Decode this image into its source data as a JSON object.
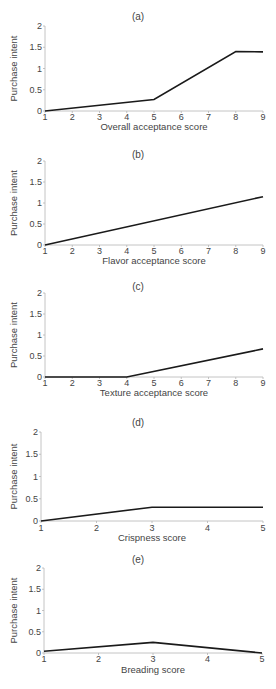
{
  "chart_data": [
    {
      "type": "line",
      "panel": "(a)",
      "title": "(a)",
      "xlabel": "Overall acceptance score",
      "ylabel": "Purchase intent",
      "x": [
        1,
        5,
        8,
        9
      ],
      "series": [
        {
          "name": "Purchase intent",
          "values": [
            0,
            0.27,
            1.4,
            1.39
          ]
        }
      ],
      "xticks": [
        1,
        2,
        3,
        4,
        5,
        6,
        7,
        8,
        9
      ],
      "yticks": [
        0,
        0.5,
        1,
        1.5,
        2
      ],
      "ytick_labels": [
        "0",
        "0.5",
        "1",
        "1.5",
        "2"
      ],
      "xlim": [
        1,
        9
      ],
      "ylim": [
        0,
        2
      ],
      "grid": false,
      "layout": {
        "top": 0,
        "height": 135,
        "x0": 45,
        "x1": 263,
        "y0": 111,
        "y2": 26,
        "title_y": 12,
        "tick_y": 120,
        "label_y": 130
      }
    },
    {
      "type": "line",
      "panel": "(b)",
      "title": "(b)",
      "xlabel": "Flavor acceptance score",
      "ylabel": "Purchase intent",
      "x": [
        1,
        9
      ],
      "series": [
        {
          "name": "Purchase intent",
          "values": [
            0,
            1.15
          ]
        }
      ],
      "xticks": [
        1,
        2,
        3,
        4,
        5,
        6,
        7,
        8,
        9
      ],
      "yticks": [
        0,
        0.5,
        1,
        1.5,
        2
      ],
      "ytick_labels": [
        "0",
        "0.5",
        "1",
        "1.5",
        "2"
      ],
      "xlim": [
        1,
        9
      ],
      "ylim": [
        0,
        2
      ],
      "grid": false,
      "layout": {
        "top": 135,
        "height": 130,
        "x0": 45,
        "x1": 263,
        "y0": 110,
        "y2": 26,
        "title_y": 15,
        "tick_y": 119,
        "label_y": 129
      }
    },
    {
      "type": "line",
      "panel": "(c)",
      "title": "(c)",
      "xlabel": "Texture acceptance score",
      "ylabel": "Purchase intent",
      "x": [
        1,
        4,
        9
      ],
      "series": [
        {
          "name": "Purchase intent",
          "values": [
            0,
            0,
            0.67
          ]
        }
      ],
      "xticks": [
        1,
        2,
        3,
        4,
        5,
        6,
        7,
        8,
        9
      ],
      "yticks": [
        0,
        0.5,
        1,
        1.5,
        2
      ],
      "ytick_labels": [
        "0",
        "0.5",
        "1",
        "1.5",
        "2"
      ],
      "xlim": [
        1,
        9
      ],
      "ylim": [
        0,
        2
      ],
      "grid": false,
      "layout": {
        "top": 265,
        "height": 130,
        "x0": 45,
        "x1": 263,
        "y0": 112,
        "y2": 28,
        "title_y": 17,
        "tick_y": 121,
        "label_y": 131
      }
    },
    {
      "type": "line",
      "panel": "(d)",
      "title": "(d)",
      "xlabel": "Crispness score",
      "ylabel": "Purchase intent",
      "x": [
        1,
        3,
        5
      ],
      "series": [
        {
          "name": "Purchase intent",
          "values": [
            0,
            0.31,
            0.31
          ]
        }
      ],
      "xticks": [
        1,
        2,
        3,
        4,
        5
      ],
      "yticks": [
        0,
        0.5,
        1,
        1.5,
        2
      ],
      "ytick_labels": [
        "0",
        "0.5",
        "1",
        "1.5",
        "2"
      ],
      "xlim": [
        1,
        5
      ],
      "ylim": [
        0,
        2
      ],
      "grid": false,
      "layout": {
        "top": 395,
        "height": 150,
        "x0": 41,
        "x1": 263,
        "y0": 126,
        "y2": 37,
        "title_y": 23,
        "tick_y": 136,
        "label_y": 146
      }
    },
    {
      "type": "line",
      "panel": "(e)",
      "title": "(e)",
      "xlabel": "Breading score",
      "ylabel": "Purchase intent",
      "x": [
        1,
        3,
        5
      ],
      "series": [
        {
          "name": "Purchase intent",
          "values": [
            0.04,
            0.25,
            0
          ]
        }
      ],
      "xticks": [
        1,
        2,
        3,
        4,
        5
      ],
      "yticks": [
        0,
        0.5,
        1,
        1.5,
        2
      ],
      "ytick_labels": [
        "0",
        "0.5",
        "1",
        "1.5",
        "2"
      ],
      "xlim": [
        1,
        5
      ],
      "ylim": [
        0,
        2
      ],
      "grid": false,
      "layout": {
        "top": 545,
        "height": 144,
        "x0": 44,
        "x1": 262,
        "y0": 108,
        "y2": 23,
        "title_y": 10,
        "tick_y": 117,
        "label_y": 128
      }
    }
  ]
}
